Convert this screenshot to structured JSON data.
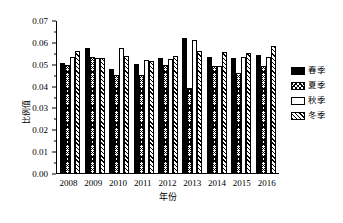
{
  "chart_data": {
    "type": "bar",
    "title": "",
    "xlabel": "年份",
    "ylabel": "比例值",
    "categories": [
      "2008",
      "2009",
      "2010",
      "2011",
      "2012",
      "2013",
      "2014",
      "2015",
      "2016"
    ],
    "series": [
      {
        "name": "春季",
        "key": "spring",
        "fill": "solid-black",
        "values": [
          0.0505,
          0.057,
          0.0478,
          0.0497,
          0.0527,
          0.0617,
          0.053,
          0.0527,
          0.0542
        ]
      },
      {
        "name": "夏季",
        "key": "summer",
        "fill": "cross-hatch",
        "values": [
          0.0494,
          0.0531,
          0.0447,
          0.0449,
          0.0495,
          0.039,
          0.0489,
          0.0457,
          0.0488
        ]
      },
      {
        "name": "秋季",
        "key": "autumn",
        "fill": "white",
        "values": [
          0.0532,
          0.0526,
          0.0574,
          0.0517,
          0.0522,
          0.0609,
          0.0489,
          0.0531,
          0.0529
        ]
      },
      {
        "name": "冬季",
        "key": "winter",
        "fill": "diagonal-hatch",
        "values": [
          0.0559,
          0.0526,
          0.0535,
          0.0513,
          0.0535,
          0.0557,
          0.0553,
          0.0549,
          0.0581
        ]
      }
    ],
    "ylim": [
      0.0,
      0.07
    ],
    "yticks": [
      "0.00",
      "0.01",
      "0.02",
      "0.03",
      "0.04",
      "0.05",
      "0.06",
      "0.07"
    ],
    "ytick_values": [
      0.0,
      0.01,
      0.02,
      0.03,
      0.04,
      0.05,
      0.06,
      0.07
    ],
    "minor_ticks": true,
    "grid": false,
    "legend_position": "right",
    "axis_color": "#000000",
    "background": "#ffffff"
  },
  "legend": {
    "items": [
      {
        "label": "春季",
        "swatch": "solid-black-swatch"
      },
      {
        "label": "夏季",
        "swatch": "cross-hatch-swatch"
      },
      {
        "label": "秋季",
        "swatch": "white-swatch"
      },
      {
        "label": "冬季",
        "swatch": "diagonal-hatch-swatch"
      }
    ]
  }
}
